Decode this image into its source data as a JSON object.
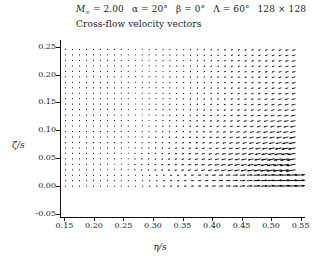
{
  "figure": {
    "title_line1_parts": {
      "mach_symbol": "M",
      "mach_sub": "∞",
      "mach_value": "= 2.00",
      "alpha": "α = 20°",
      "beta": "β = 0°",
      "lambda": "Λ = 60°",
      "grid": "128 × 128"
    },
    "title_line2": "Cross-flow velocity vectors"
  },
  "chart_data": {
    "type": "scatter",
    "plot_kind": "quiver-vector-field",
    "title": "M∞ = 2.00  α = 20°  β = 0°  Λ = 60°  128 × 128",
    "subtitle": "Cross-flow velocity vectors",
    "xlabel": "η/s",
    "ylabel": "ζ/s",
    "xlim": [
      0.1425,
      0.5575
    ],
    "ylim": [
      -0.057,
      0.262
    ],
    "xticks": [
      0.15,
      0.2,
      0.25,
      0.3,
      0.35,
      0.4,
      0.45,
      0.5,
      0.55
    ],
    "xtick_labels": [
      "0.15",
      "0.20",
      "0.25",
      "0.30",
      "0.35",
      "0.40",
      "0.45",
      "0.50",
      "0.55"
    ],
    "yticks": [
      -0.05,
      0.0,
      0.05,
      0.1,
      0.15,
      0.2,
      0.25
    ],
    "ytick_labels": [
      "-0.05",
      "0.00",
      "0.05",
      "0.10",
      "0.15",
      "0.20",
      "0.25"
    ],
    "grid": false,
    "legend": null,
    "vector_color": "#000000",
    "field_description": "Cross-flow velocity vectors over a delta wing at Mach 2, 20 deg angle of attack, 60 deg sweep. Vectors are short and nearly stagnant in the left-mid region, tilt down-left and grow in magnitude toward the right, and reverse direction across a thin shear layer near zeta/s = 0.02 where flow below points right (outboard) and flow above points left (inboard).",
    "shear_layer_zeta": 0.02,
    "grid_nx": 34,
    "grid_ny": 26,
    "x_start": 0.152,
    "x_step": 0.0118,
    "y_start": 0.0,
    "y_step": 0.0098
  }
}
